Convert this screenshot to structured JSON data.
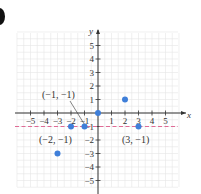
{
  "chart_data": {
    "type": "scatter",
    "title": "",
    "xlabel": "x",
    "ylabel": "y",
    "xlim": [
      -5,
      5
    ],
    "ylim": [
      -5,
      5
    ],
    "grid": true,
    "x_ticks": [
      -5,
      -4,
      -3,
      -2,
      -1,
      1,
      2,
      3,
      4,
      5
    ],
    "y_ticks": [
      -5,
      -4,
      -3,
      -2,
      -1,
      1,
      2,
      3,
      4,
      5
    ],
    "x_tick_labels": [
      "−5",
      "−4",
      "−3",
      "−2",
      "−1",
      "1",
      "2",
      "3",
      "4",
      "5"
    ],
    "y_tick_labels": [
      "−5",
      "−4",
      "−3",
      "−2",
      "−1",
      "1",
      "2",
      "3",
      "4",
      "5"
    ],
    "series": [
      {
        "name": "points",
        "color": "#3f7fd9",
        "points": [
          [
            -3,
            -3
          ],
          [
            -2,
            -1
          ],
          [
            -1,
            -1
          ],
          [
            0,
            0
          ],
          [
            2,
            1
          ],
          [
            3,
            -1
          ]
        ]
      }
    ],
    "reference_lines": [
      {
        "type": "horizontal",
        "y": -1,
        "style": "dashed",
        "color": "#e06b96"
      }
    ],
    "annotations": [
      {
        "text": "(−1, −1)",
        "point": [
          -1,
          -1
        ],
        "leader_line": true
      },
      {
        "text": "(−2, −1)",
        "point": [
          -2,
          -1
        ]
      },
      {
        "text": "(3, −1)",
        "point": [
          3,
          -1
        ]
      }
    ]
  },
  "colors": {
    "axis": "#333333",
    "grid": "#e6e6e6",
    "point": "#3f7fd9",
    "dashed_line": "#e06b96",
    "text": "#333333"
  }
}
